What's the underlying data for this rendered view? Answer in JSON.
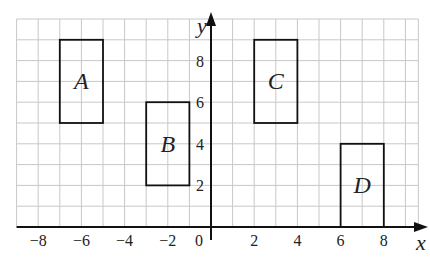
{
  "figure": {
    "axes": {
      "x_label": "x",
      "y_label": "y",
      "origin_label": "0",
      "x_ticks": [
        {
          "value": -8,
          "label": "−8"
        },
        {
          "value": -6,
          "label": "−6"
        },
        {
          "value": -4,
          "label": "−4"
        },
        {
          "value": -2,
          "label": "−2"
        },
        {
          "value": 2,
          "label": "2"
        },
        {
          "value": 4,
          "label": "4"
        },
        {
          "value": 6,
          "label": "6"
        },
        {
          "value": 8,
          "label": "8"
        }
      ],
      "y_ticks": [
        {
          "value": 2,
          "label": "2"
        },
        {
          "value": 4,
          "label": "4"
        },
        {
          "value": 6,
          "label": "6"
        },
        {
          "value": 8,
          "label": "8"
        }
      ],
      "grid": {
        "x_min": -9,
        "x_max": 9.6,
        "y_min": 0,
        "y_max": 10,
        "step": 1
      }
    },
    "rectangles": [
      {
        "label": "A",
        "x1": -7,
        "y1": 5,
        "x2": -5,
        "y2": 9
      },
      {
        "label": "B",
        "x1": -3,
        "y1": 2,
        "x2": -1,
        "y2": 6
      },
      {
        "label": "C",
        "x1": 2,
        "y1": 5,
        "x2": 4,
        "y2": 9
      },
      {
        "label": "D",
        "x1": 6,
        "y1": 0,
        "x2": 8,
        "y2": 4
      }
    ],
    "colors": {
      "grid": "#c8c8c8",
      "axis": "#111111",
      "shape": "#111111"
    }
  }
}
